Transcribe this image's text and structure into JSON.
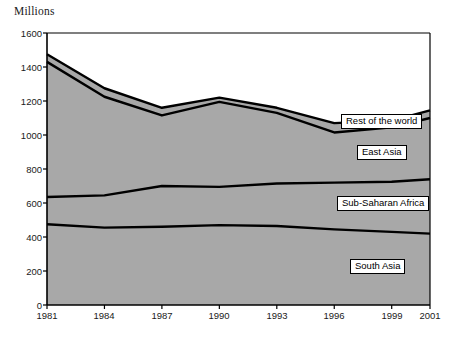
{
  "chart_data": {
    "type": "area",
    "title": "",
    "ylabel": "Millions",
    "xlabel": "",
    "ylim": [
      0,
      1600
    ],
    "xlim": [
      1981,
      2001
    ],
    "grid": false,
    "stacked": true,
    "legend_position": "inline-labels",
    "y_ticks": [
      0,
      200,
      400,
      600,
      800,
      1000,
      1200,
      1400,
      1600
    ],
    "x_ticks": [
      1981,
      1984,
      1987,
      1990,
      1993,
      1996,
      1999,
      2001
    ],
    "x": [
      1981,
      1984,
      1987,
      1990,
      1993,
      1996,
      1999,
      2001
    ],
    "series": [
      {
        "name": "South Asia",
        "color": "#a8a8a8",
        "values": [
          475,
          455,
          460,
          470,
          465,
          445,
          430,
          420
        ]
      },
      {
        "name": "Sub-Saharan Africa",
        "color": "#a8a8a8",
        "values": [
          160,
          190,
          240,
          225,
          250,
          275,
          295,
          320
        ]
      },
      {
        "name": "East Asia",
        "color": "#a8a8a8",
        "values": [
          795,
          580,
          415,
          500,
          415,
          295,
          320,
          360
        ]
      },
      {
        "name": "Rest of the world",
        "color": "#a8a8a8",
        "values": [
          45,
          50,
          45,
          25,
          30,
          55,
          40,
          45
        ]
      }
    ],
    "cumulative_totals": [
      1475,
      1275,
      1160,
      1220,
      1160,
      1070,
      1085,
      1145
    ],
    "annotations": [
      {
        "text": "Rest of the world",
        "x": 1996,
        "y": 1090
      },
      {
        "text": "East Asia",
        "x": 1997,
        "y": 905
      },
      {
        "text": "Sub-Saharan Africa",
        "x": 1996,
        "y": 615
      },
      {
        "text": "South Asia",
        "x": 1995,
        "y": 280
      }
    ]
  },
  "labels": {
    "y_axis_title": "Millions",
    "y_1600": "1600",
    "y_1400": "1400",
    "y_1200": "1200",
    "y_1000": "1000",
    "y_800": "800",
    "y_600": "600",
    "y_400": "400",
    "y_200": "200",
    "y_0": "0",
    "x_1981": "1981",
    "x_1984": "1984",
    "x_1987": "1987",
    "x_1990": "1990",
    "x_1993": "1993",
    "x_1996": "1996",
    "x_1999": "1999",
    "x_2001": "2001",
    "series_rest": "Rest of the world",
    "series_east_asia": "East Asia",
    "series_ssa": "Sub-Saharan Africa",
    "series_south_asia": "South Asia",
    "footnote": ""
  },
  "colors": {
    "fill": "#a8a8a8",
    "line": "#000000",
    "axis": "#000000",
    "background": "#ffffff"
  }
}
